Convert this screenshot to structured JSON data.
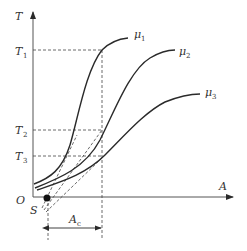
{
  "axes": {
    "y_label": "T",
    "x_label": "A",
    "origin_label": "O"
  },
  "levels": [
    {
      "name": "T",
      "sub": "1"
    },
    {
      "name": "T",
      "sub": "2"
    },
    {
      "name": "T",
      "sub": "3"
    }
  ],
  "curves": [
    {
      "name": "μ",
      "sub": "1"
    },
    {
      "name": "μ",
      "sub": "2"
    },
    {
      "name": "μ",
      "sub": "3"
    }
  ],
  "points": {
    "s_label": "S"
  },
  "interval": {
    "name": "A",
    "sub": "c"
  },
  "colors": {
    "line": "#2a2a2a",
    "dashed": "#444444"
  }
}
